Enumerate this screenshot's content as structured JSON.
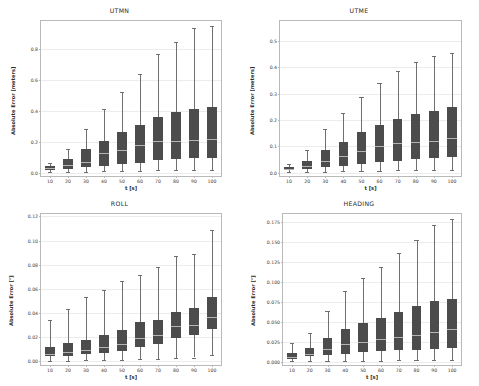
{
  "figure": {
    "width": 479,
    "height": 386,
    "background": "#ffffff",
    "box_color": "#4c4c4c",
    "median_color": "#b3b3b3",
    "whisker_color": "#6f6f6f",
    "grid_color": "#ececec",
    "frame_color": "#b9b9b9"
  },
  "chart_data": [
    {
      "type": "box",
      "id": "utmn",
      "title": "UTMN",
      "xlabel": "t [s]",
      "ylabel": "Absolute Error [meters]",
      "categories": [
        "10",
        "20",
        "30",
        "40",
        "50",
        "60",
        "70",
        "80",
        "90",
        "100"
      ],
      "ylim": [
        -0.02,
        0.98
      ],
      "yticks": [
        0.0,
        0.2,
        0.4,
        0.6,
        0.8
      ],
      "ytick_labels": [
        "0.0",
        "0.2",
        "0.4",
        "0.6",
        "0.8"
      ],
      "grid": true,
      "boxes": [
        {
          "x": "10",
          "whisker_low": 0.005,
          "q1": 0.018,
          "median": 0.029,
          "q3": 0.042,
          "whisker_high": 0.062
        },
        {
          "x": "20",
          "whisker_low": 0.006,
          "q1": 0.028,
          "median": 0.052,
          "q3": 0.088,
          "whisker_high": 0.153
        },
        {
          "x": "30",
          "whisker_low": 0.008,
          "q1": 0.04,
          "median": 0.068,
          "q3": 0.152,
          "whisker_high": 0.283
        },
        {
          "x": "40",
          "whisker_low": 0.01,
          "q1": 0.042,
          "median": 0.131,
          "q3": 0.204,
          "whisker_high": 0.412
        },
        {
          "x": "50",
          "whisker_low": 0.012,
          "q1": 0.06,
          "median": 0.147,
          "q3": 0.262,
          "whisker_high": 0.525
        },
        {
          "x": "60",
          "whisker_low": 0.013,
          "q1": 0.065,
          "median": 0.182,
          "q3": 0.31,
          "whisker_high": 0.64
        },
        {
          "x": "70",
          "whisker_low": 0.016,
          "q1": 0.085,
          "median": 0.207,
          "q3": 0.36,
          "whisker_high": 0.765
        },
        {
          "x": "80",
          "whisker_low": 0.017,
          "q1": 0.09,
          "median": 0.205,
          "q3": 0.395,
          "whisker_high": 0.845
        },
        {
          "x": "90",
          "whisker_low": 0.017,
          "q1": 0.095,
          "median": 0.212,
          "q3": 0.415,
          "whisker_high": 0.935
        },
        {
          "x": "100",
          "whisker_low": 0.018,
          "q1": 0.098,
          "median": 0.218,
          "q3": 0.425,
          "whisker_high": 0.945
        }
      ]
    },
    {
      "type": "box",
      "id": "utme",
      "title": "UTME",
      "xlabel": "t [s]",
      "ylabel": "Absolute Error [meters]",
      "categories": [
        "10",
        "20",
        "30",
        "40",
        "50",
        "60",
        "70",
        "80",
        "90",
        "100"
      ],
      "ylim": [
        -0.012,
        0.575
      ],
      "yticks": [
        0.0,
        0.1,
        0.2,
        0.3,
        0.4,
        0.5
      ],
      "ytick_labels": [
        "0.0",
        "0.1",
        "0.2",
        "0.3",
        "0.4",
        "0.5"
      ],
      "grid": true,
      "boxes": [
        {
          "x": "10",
          "whisker_low": 0.002,
          "q1": 0.009,
          "median": 0.015,
          "q3": 0.022,
          "whisker_high": 0.035
        },
        {
          "x": "20",
          "whisker_low": 0.004,
          "q1": 0.015,
          "median": 0.026,
          "q3": 0.046,
          "whisker_high": 0.087
        },
        {
          "x": "30",
          "whisker_low": 0.005,
          "q1": 0.022,
          "median": 0.043,
          "q3": 0.086,
          "whisker_high": 0.167
        },
        {
          "x": "40",
          "whisker_low": 0.006,
          "q1": 0.025,
          "median": 0.062,
          "q3": 0.118,
          "whisker_high": 0.226
        },
        {
          "x": "50",
          "whisker_low": 0.007,
          "q1": 0.032,
          "median": 0.081,
          "q3": 0.154,
          "whisker_high": 0.288
        },
        {
          "x": "60",
          "whisker_low": 0.008,
          "q1": 0.04,
          "median": 0.103,
          "q3": 0.18,
          "whisker_high": 0.34
        },
        {
          "x": "70",
          "whisker_low": 0.01,
          "q1": 0.046,
          "median": 0.112,
          "q3": 0.203,
          "whisker_high": 0.385
        },
        {
          "x": "80",
          "whisker_low": 0.011,
          "q1": 0.052,
          "median": 0.117,
          "q3": 0.222,
          "whisker_high": 0.42
        },
        {
          "x": "90",
          "whisker_low": 0.012,
          "q1": 0.056,
          "median": 0.122,
          "q3": 0.236,
          "whisker_high": 0.442
        },
        {
          "x": "100",
          "whisker_low": 0.012,
          "q1": 0.06,
          "median": 0.132,
          "q3": 0.248,
          "whisker_high": 0.452
        }
      ]
    },
    {
      "type": "box",
      "id": "roll",
      "title": "ROLL",
      "xlabel": "t [s]",
      "ylabel": "Absolute Error [°]",
      "categories": [
        "10",
        "20",
        "30",
        "40",
        "50",
        "60",
        "70",
        "80",
        "90",
        "100"
      ],
      "ylim": [
        -0.003,
        0.122
      ],
      "yticks": [
        0.0,
        0.02,
        0.04,
        0.06,
        0.08,
        0.1,
        0.12
      ],
      "ytick_labels": [
        "0.00",
        "0.02",
        "0.04",
        "0.06",
        "0.08",
        "0.10",
        "0.12"
      ],
      "grid": true,
      "boxes": [
        {
          "x": "10",
          "whisker_low": 0.0005,
          "q1": 0.0042,
          "median": 0.0065,
          "q3": 0.0123,
          "whisker_high": 0.0345
        },
        {
          "x": "20",
          "whisker_low": 0.0006,
          "q1": 0.0048,
          "median": 0.008,
          "q3": 0.0148,
          "whisker_high": 0.0432
        },
        {
          "x": "30",
          "whisker_low": 0.0008,
          "q1": 0.0058,
          "median": 0.0098,
          "q3": 0.0178,
          "whisker_high": 0.0533
        },
        {
          "x": "40",
          "whisker_low": 0.001,
          "q1": 0.0068,
          "median": 0.0118,
          "q3": 0.0218,
          "whisker_high": 0.0595
        },
        {
          "x": "50",
          "whisker_low": 0.0012,
          "q1": 0.0082,
          "median": 0.014,
          "q3": 0.0262,
          "whisker_high": 0.0665
        },
        {
          "x": "60",
          "whisker_low": 0.0016,
          "q1": 0.0122,
          "median": 0.019,
          "q3": 0.0322,
          "whisker_high": 0.0712
        },
        {
          "x": "70",
          "whisker_low": 0.002,
          "q1": 0.0142,
          "median": 0.0222,
          "q3": 0.034,
          "whisker_high": 0.0785
        },
        {
          "x": "80",
          "whisker_low": 0.0028,
          "q1": 0.0192,
          "median": 0.0292,
          "q3": 0.041,
          "whisker_high": 0.0875
        },
        {
          "x": "90",
          "whisker_low": 0.0032,
          "q1": 0.0222,
          "median": 0.0305,
          "q3": 0.044,
          "whisker_high": 0.089
        },
        {
          "x": "100",
          "whisker_low": 0.0052,
          "q1": 0.0272,
          "median": 0.037,
          "q3": 0.053,
          "whisker_high": 0.109
        }
      ]
    },
    {
      "type": "box",
      "id": "heading",
      "title": "HEADING",
      "xlabel": "t [s]",
      "ylabel": "Absolute Error [°]",
      "categories": [
        "10",
        "20",
        "30",
        "40",
        "50",
        "60",
        "70",
        "80",
        "90",
        "100"
      ],
      "ylim": [
        -0.004,
        0.185
      ],
      "yticks": [
        0.0,
        0.025,
        0.05,
        0.075,
        0.1,
        0.125,
        0.15,
        0.175
      ],
      "ytick_labels": [
        "0.000",
        "0.025",
        "0.050",
        "0.075",
        "0.100",
        "0.125",
        "0.150",
        "0.175"
      ],
      "grid": true,
      "boxes": [
        {
          "x": "10",
          "whisker_low": 0.0008,
          "q1": 0.0035,
          "median": 0.0055,
          "q3": 0.011,
          "whisker_high": 0.0235
        },
        {
          "x": "20",
          "whisker_low": 0.001,
          "q1": 0.0072,
          "median": 0.0098,
          "q3": 0.017,
          "whisker_high": 0.0362
        },
        {
          "x": "30",
          "whisker_low": 0.0012,
          "q1": 0.009,
          "median": 0.0155,
          "q3": 0.03,
          "whisker_high": 0.064
        },
        {
          "x": "40",
          "whisker_low": 0.0013,
          "q1": 0.0098,
          "median": 0.0222,
          "q3": 0.0412,
          "whisker_high": 0.089
        },
        {
          "x": "50",
          "whisker_low": 0.0014,
          "q1": 0.0128,
          "median": 0.025,
          "q3": 0.0482,
          "whisker_high": 0.105
        },
        {
          "x": "60",
          "whisker_low": 0.0016,
          "q1": 0.0138,
          "median": 0.0282,
          "q3": 0.055,
          "whisker_high": 0.1182
        },
        {
          "x": "70",
          "whisker_low": 0.0018,
          "q1": 0.0148,
          "median": 0.0305,
          "q3": 0.062,
          "whisker_high": 0.1365
        },
        {
          "x": "80",
          "whisker_low": 0.0019,
          "q1": 0.0152,
          "median": 0.033,
          "q3": 0.07,
          "whisker_high": 0.153
        },
        {
          "x": "90",
          "whisker_low": 0.002,
          "q1": 0.0158,
          "median": 0.0372,
          "q3": 0.076,
          "whisker_high": 0.1715
        },
        {
          "x": "100",
          "whisker_low": 0.002,
          "q1": 0.0168,
          "median": 0.0412,
          "q3": 0.079,
          "whisker_high": 0.179
        }
      ]
    }
  ]
}
